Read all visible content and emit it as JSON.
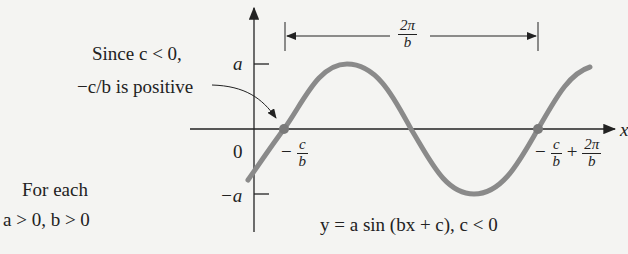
{
  "annotations": {
    "since_line1": "Since c < 0,",
    "since_line2": "−c/b is positive",
    "for_each_line1": "For each",
    "for_each_line2": "a > 0, b > 0",
    "equation": "y = a sin (bx + c), c < 0"
  },
  "axis_labels": {
    "y_top": "a",
    "y_zero": "0",
    "y_bottom": "−a",
    "x_axis": "x"
  },
  "period_label": {
    "num": "2π",
    "den": "b"
  },
  "zero_crossing_1": {
    "prefix": "−",
    "num": "c",
    "den": "b"
  },
  "zero_crossing_2": {
    "prefix": "−",
    "num": "c",
    "den": "b",
    "plus": "+",
    "num2": "2π",
    "den2": "b"
  },
  "colors": {
    "curve": "#8a8a8a",
    "axes": "#222222",
    "background": "#f4f4f2"
  }
}
